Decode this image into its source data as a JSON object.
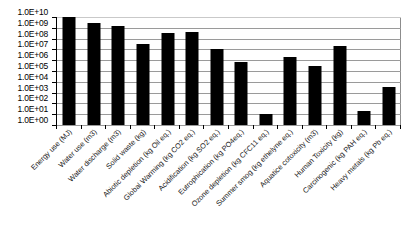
{
  "chart_data": {
    "type": "bar",
    "title": "",
    "xlabel": "",
    "ylabel": "",
    "yscale": "log",
    "ylim": [
      1,
      10000000000
    ],
    "grid": true,
    "legend": "none",
    "series_color": "#000000",
    "ytick_labels": [
      "1.0E+10",
      "1.0E+09",
      "1.0E+08",
      "1.0E+07",
      "1.0E+06",
      "1.0E+05",
      "1.0E+04",
      "1.0E+03",
      "1.0E+02",
      "1.0E+01",
      "1.0E+00"
    ],
    "ytick_values": [
      10000000000,
      1000000000,
      100000000,
      10000000,
      1000000,
      100000,
      10000,
      1000,
      100,
      10,
      1
    ],
    "categories": [
      "Energy use (MJ)",
      "Water use (m3)",
      "Water discharge (m3)",
      "Solid waste (kg)",
      "Abiotic depletion (kg Oil eq.)",
      "Global Warming (kg CO2 eq.)",
      "Acidification (kg SO2 eq.)",
      "Eutrophication (kg PO4eq.)",
      "Ozone depletion (kg CFC11 eq.)",
      "Summer smog (kg ethelyne eq.)",
      "Aquatice cotoxicity (m3)",
      "Human Toxicity (kg)",
      "Carcinogenic (kg PAH eq.)",
      "Heavy metals (kg Pb eq.)"
    ],
    "values": [
      10000000000,
      3000000000,
      1500000000,
      30000000,
      300000000,
      400000000,
      10000000,
      700000,
      10,
      2000000,
      300000,
      20000000,
      20,
      3000
    ]
  }
}
